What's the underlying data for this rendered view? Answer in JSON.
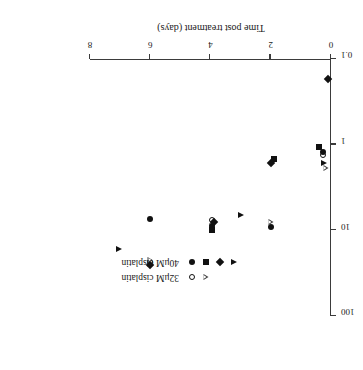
{
  "chart_data": {
    "type": "scatter",
    "title": "",
    "xlabel": "Time post treatment (days)",
    "ylabel": "Plating efficiency  (% of control)",
    "xlim": [
      0,
      8
    ],
    "ylim": [
      0.1,
      100
    ],
    "yscale": "log",
    "grid": false,
    "rotation_deg": 180,
    "xticks": [
      "0",
      "2",
      "4",
      "6",
      "8"
    ],
    "xtick_values": [
      0,
      2,
      4,
      6,
      8
    ],
    "yticks": [
      "0.1",
      "1",
      "10",
      "100"
    ],
    "ytick_values": [
      0.1,
      1,
      10,
      100
    ],
    "legend": {
      "position": "inside-right",
      "entries": [
        {
          "label": "32μM cisplatin",
          "markers": [
            "circle-open",
            "triangle-open"
          ]
        },
        {
          "label": "40μM cisplatin",
          "markers": [
            "circle-filled",
            "square-filled",
            "diamond-filled",
            "triangle-filled"
          ]
        }
      ]
    },
    "series": [
      {
        "name": "32μM cisplatin",
        "marker": "circle-open",
        "points": [
          {
            "x": 0.25,
            "y": 1.32
          },
          {
            "x": 3.95,
            "y": 7.6
          },
          {
            "x": 6.0,
            "y": 23.5
          }
        ]
      },
      {
        "name": "32μM cisplatin",
        "marker": "triangle-open",
        "points": [
          {
            "x": 0.18,
            "y": 1.85
          },
          {
            "x": 2.0,
            "y": 9.4
          },
          {
            "x": 3.95,
            "y": 12.4
          },
          {
            "x": 6.0,
            "y": 36.0
          }
        ]
      },
      {
        "name": "40μM cisplatin",
        "marker": "circle-filled",
        "points": [
          {
            "x": 0.25,
            "y": 1.22
          },
          {
            "x": 2.0,
            "y": 9.1
          },
          {
            "x": 3.95,
            "y": 8.9
          },
          {
            "x": 6.0,
            "y": 7.3
          }
        ]
      },
      {
        "name": "40μM cisplatin",
        "marker": "square-filled",
        "points": [
          {
            "x": 0.4,
            "y": 1.06
          },
          {
            "x": 1.9,
            "y": 1.48
          },
          {
            "x": 3.95,
            "y": 9.9
          }
        ]
      },
      {
        "name": "40μM cisplatin",
        "marker": "diamond-filled",
        "points": [
          {
            "x": 0.1,
            "y": 0.17
          },
          {
            "x": 2.0,
            "y": 1.62
          },
          {
            "x": 3.9,
            "y": 7.9
          },
          {
            "x": 6.0,
            "y": 25.5
          }
        ]
      },
      {
        "name": "40μM cisplatin",
        "marker": "triangle-filled",
        "points": [
          {
            "x": 0.22,
            "y": 1.62
          },
          {
            "x": 1.9,
            "y": 1.52
          },
          {
            "x": 3.0,
            "y": 6.6
          },
          {
            "x": 7.05,
            "y": 16.6
          }
        ]
      }
    ]
  }
}
